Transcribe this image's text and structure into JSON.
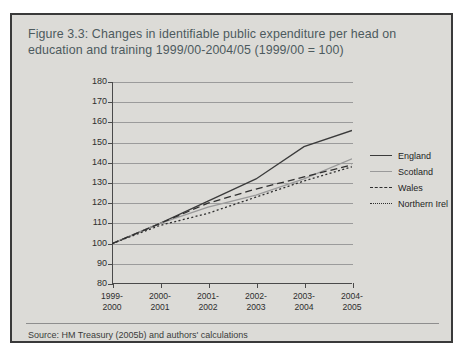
{
  "figure": {
    "title": "Figure 3.3: Changes in identifiable public expenditure per head on education and training 1999/00-2004/05 (1999/00 = 100)",
    "source": "Source: HM Treasury (2005b) and authors' calculations"
  },
  "colors": {
    "frame_border": "#3a3a3a",
    "panel_background": "#dcdbd7",
    "title_text": "#4d5a5e",
    "axis": "#4a4a4a",
    "gridline": "#9b9b9b",
    "england": "#3b3b3b",
    "scotland": "#9a9a9a",
    "wales": "#2f2f2f",
    "northern_ireland": "#2f2f2f"
  },
  "chart_data": {
    "type": "line",
    "title": "Figure 3.3: Changes in identifiable public expenditure per head on education and training 1999/00-2004/05 (1999/00 = 100)",
    "xlabel": "",
    "ylabel": "",
    "ylim": [
      80,
      180
    ],
    "ytick_step": 10,
    "yticks": [
      80,
      90,
      100,
      110,
      120,
      130,
      140,
      150,
      160,
      170,
      180
    ],
    "grid": true,
    "legend_position": "right",
    "categories": [
      "1999-2000",
      "2000-2001",
      "2001-2002",
      "2002-2003",
      "2003-2004",
      "2004-2005"
    ],
    "category_lines": [
      [
        "1999-",
        "2000"
      ],
      [
        "2000-",
        "2001"
      ],
      [
        "2001-",
        "2002"
      ],
      [
        "2002-",
        "2003"
      ],
      [
        "2003-",
        "2004"
      ],
      [
        "2004-",
        "2005"
      ]
    ],
    "series": [
      {
        "name": "England",
        "style": "solid",
        "color": "#3b3b3b",
        "values": [
          100,
          110,
          121,
          132,
          148,
          156
        ]
      },
      {
        "name": "Scotland",
        "style": "solid",
        "color": "#9a9a9a",
        "values": [
          100,
          110,
          118,
          124,
          132,
          142
        ]
      },
      {
        "name": "Wales",
        "style": "dashed",
        "color": "#2f2f2f",
        "values": [
          100,
          110,
          120,
          127,
          133,
          139
        ]
      },
      {
        "name": "Northern Irel",
        "style": "dotted",
        "color": "#2f2f2f",
        "values": [
          100,
          109,
          115,
          123,
          131,
          138
        ]
      }
    ]
  }
}
